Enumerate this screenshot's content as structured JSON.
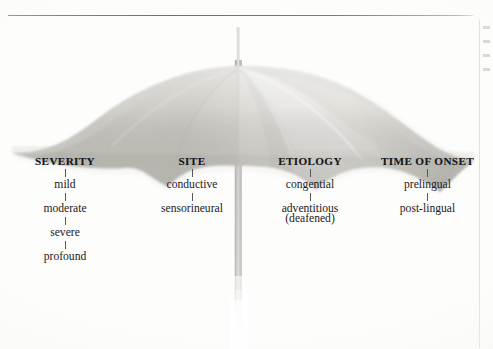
{
  "figure": {
    "title_rule": "horizontal-rule",
    "colors": {
      "canopy_light": "#e3e2de",
      "canopy_mid": "#cfcdc8",
      "canopy_dark": "#bdbbb5",
      "shaft": "#cdccc8",
      "text": "#1d1d1d",
      "rule": "#7a7a7a"
    }
  },
  "columns": [
    {
      "id": "severity",
      "header": "SEVERITY",
      "items": [
        "mild",
        "moderate",
        "severe",
        "profound"
      ]
    },
    {
      "id": "site",
      "header": "SITE",
      "items": [
        "conductive",
        "sensorineural"
      ]
    },
    {
      "id": "etiology",
      "header": "ETIOLOGY",
      "items": [
        "congential",
        "adventitious",
        "(deafened)"
      ]
    },
    {
      "id": "time_of_onset",
      "header": "TIME OF ONSET",
      "items": [
        "prelingual",
        "post-lingual"
      ]
    }
  ]
}
